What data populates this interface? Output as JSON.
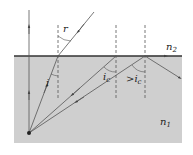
{
  "diagram": {
    "colors": {
      "medium1": "#cfcfcf",
      "interface": "#333333",
      "ray": "#555555",
      "dashed_normal": "#555555",
      "text": "#222222"
    },
    "media": {
      "upper": {
        "label": "n",
        "subscript": "2"
      },
      "lower": {
        "label": "n",
        "subscript": "1"
      }
    },
    "angles": {
      "refraction": "r",
      "incidence": "i",
      "critical": {
        "label": "i",
        "subscript": "c"
      },
      "greater_than_critical": {
        "prefix": ">",
        "label": "i",
        "subscript": "c"
      }
    },
    "rays": [
      {
        "name": "normal-ray",
        "description": "vertical ray passes straight through"
      },
      {
        "name": "refracted-ray",
        "description": "ray at angle i refracts at angle r"
      },
      {
        "name": "critical-ray",
        "description": "ray at critical angle grazes the surface"
      },
      {
        "name": "reflected-ray",
        "description": "ray beyond critical angle is totally reflected"
      }
    ]
  }
}
